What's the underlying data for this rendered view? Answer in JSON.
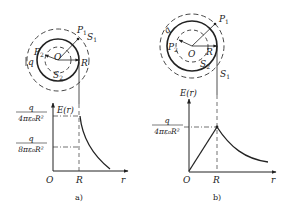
{
  "panel_a": {
    "caption": "a)",
    "labels": {
      "P1": "P",
      "P1_sub": "1",
      "S1": "S",
      "S1_sub": "1",
      "P2": "P",
      "P2_sub": "2",
      "S2": "S",
      "S2_sub": "2",
      "O": "O",
      "R": "R",
      "q": "q"
    },
    "axis": {
      "y_label": "E(r)",
      "x_label": "r",
      "origin": "O",
      "x_tick": "R",
      "y_tick_upper_num": "q",
      "y_tick_upper_den": "4πε₀R²",
      "y_tick_lower_num": "q",
      "y_tick_lower_den": "8πε₀R²"
    }
  },
  "panel_b": {
    "caption": "b)",
    "labels": {
      "P1": "P",
      "P1_sub": "1",
      "S1": "S",
      "S1_sub": "1",
      "P2": "P",
      "P2_sub": "2",
      "S2": "S",
      "S2_sub": "2",
      "O": "O",
      "R": "R",
      "q": "q"
    },
    "axis": {
      "y_label": "E(r)",
      "x_label": "r",
      "origin": "O",
      "x_tick": "R",
      "y_tick_num": "q",
      "y_tick_den": "4πε₀R²"
    }
  }
}
